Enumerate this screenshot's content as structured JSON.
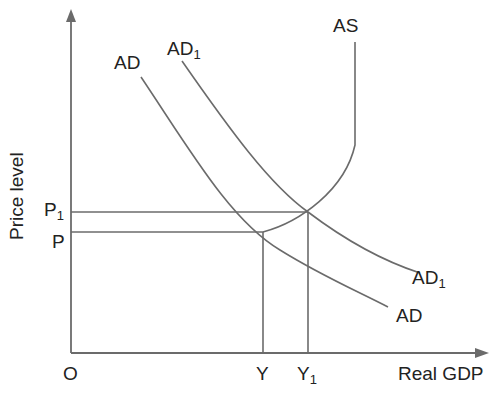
{
  "diagram": {
    "axes": {
      "y_label": "Price level",
      "x_label": "Real GDP",
      "origin_label": "O"
    },
    "price_labels": {
      "p1_main": "P",
      "p1_sub": "1",
      "p_main": "P"
    },
    "output_labels": {
      "y_main": "Y",
      "y1_main": "Y",
      "y1_sub": "1"
    },
    "curves": {
      "as_label": "AS",
      "ad_label_top": "AD",
      "ad1_label_top_main": "AD",
      "ad1_label_top_sub": "1",
      "ad_label_bottom": "AD",
      "ad1_label_bottom_main": "AD",
      "ad1_label_bottom_sub": "1"
    },
    "line_color": "#6b6b6b",
    "text_color": "#222222"
  }
}
